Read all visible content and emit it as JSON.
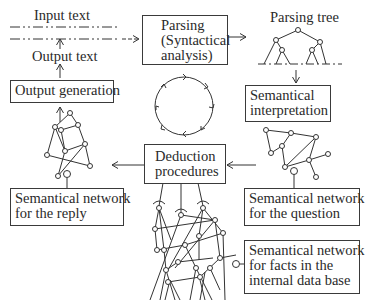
{
  "diagram": {
    "labels": {
      "input_text": "Input text",
      "output_text": "Output text",
      "parsing_tree": "Parsing tree"
    },
    "boxes": {
      "parsing": [
        "Parsing",
        "(Syntactical",
        "analysis)"
      ],
      "output_generation": [
        "Output generation"
      ],
      "semantical_interpretation": [
        "Semantical",
        "interpretation"
      ],
      "deduction_procedures": [
        "Deduction",
        "procedures"
      ],
      "network_reply": [
        "Semantical network",
        "for the reply"
      ],
      "network_question": [
        "Semantical network",
        "for the question"
      ],
      "network_facts": [
        "Semantical network",
        "for facts in the",
        "internal data base"
      ]
    },
    "flow": [
      "Input text -> Parsing (Syntactical analysis)",
      "Parsing (Syntactical analysis) -> Parsing tree",
      "Parsing tree -> Semantical interpretation",
      "Semantical interpretation -> Semantical network for the question",
      "Semantical network for the question -> Deduction procedures",
      "Semantical network for facts in the internal data base -> Deduction procedures",
      "Deduction procedures -> Semantical network for the reply",
      "Semantical network for the reply -> Output generation",
      "Output generation -> Output text"
    ],
    "center_icon": "cycle-arrows-icon"
  }
}
